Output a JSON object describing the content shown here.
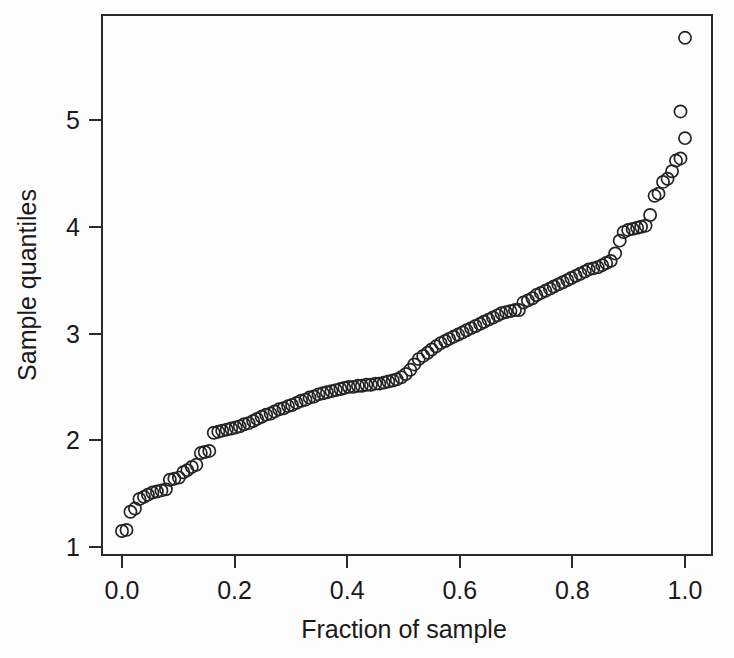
{
  "chart_data": {
    "type": "scatter",
    "title": "",
    "xlabel": "Fraction of sample",
    "ylabel": "Sample quantiles",
    "xlim": [
      -0.022,
      1.045
    ],
    "ylim": [
      1.0,
      5.95
    ],
    "grid": false,
    "legend": null,
    "marker": "open-circle",
    "xticks": [
      0.0,
      0.2,
      0.4,
      0.6,
      0.8,
      1.0
    ],
    "xtick_labels": [
      "0.0",
      "0.2",
      "0.4",
      "0.6",
      "0.8",
      "1.0"
    ],
    "yticks": [
      1,
      2,
      3,
      4,
      5
    ],
    "ytick_labels": [
      "1",
      "2",
      "3",
      "4",
      "5"
    ],
    "n_points": 130,
    "series": [
      {
        "name": "sample quantiles",
        "x": [
          0.0,
          0.008,
          0.015,
          0.023,
          0.031,
          0.039,
          0.046,
          0.054,
          0.062,
          0.07,
          0.078,
          0.085,
          0.093,
          0.101,
          0.109,
          0.116,
          0.124,
          0.132,
          0.14,
          0.147,
          0.155,
          0.163,
          0.171,
          0.178,
          0.186,
          0.194,
          0.202,
          0.209,
          0.217,
          0.225,
          0.233,
          0.24,
          0.248,
          0.256,
          0.264,
          0.271,
          0.279,
          0.287,
          0.295,
          0.302,
          0.31,
          0.318,
          0.326,
          0.333,
          0.341,
          0.349,
          0.357,
          0.364,
          0.372,
          0.38,
          0.388,
          0.395,
          0.403,
          0.411,
          0.419,
          0.426,
          0.434,
          0.442,
          0.45,
          0.457,
          0.465,
          0.473,
          0.481,
          0.488,
          0.496,
          0.504,
          0.512,
          0.519,
          0.527,
          0.535,
          0.543,
          0.55,
          0.558,
          0.566,
          0.574,
          0.581,
          0.589,
          0.597,
          0.605,
          0.612,
          0.62,
          0.628,
          0.636,
          0.643,
          0.651,
          0.659,
          0.667,
          0.674,
          0.682,
          0.69,
          0.698,
          0.705,
          0.713,
          0.721,
          0.729,
          0.736,
          0.744,
          0.752,
          0.76,
          0.767,
          0.775,
          0.783,
          0.791,
          0.798,
          0.806,
          0.814,
          0.822,
          0.829,
          0.837,
          0.845,
          0.853,
          0.86,
          0.868,
          0.876,
          0.884,
          0.891,
          0.899,
          0.907,
          0.915,
          0.922,
          0.93,
          0.938,
          0.946,
          0.953,
          0.961,
          0.969,
          0.977,
          0.984,
          0.992,
          1.0
        ],
        "y": [
          1.15,
          1.16,
          1.33,
          1.36,
          1.45,
          1.47,
          1.49,
          1.51,
          1.52,
          1.53,
          1.54,
          1.63,
          1.64,
          1.65,
          1.7,
          1.72,
          1.75,
          1.77,
          1.88,
          1.89,
          1.9,
          2.07,
          2.08,
          2.09,
          2.1,
          2.11,
          2.12,
          2.13,
          2.15,
          2.16,
          2.18,
          2.2,
          2.22,
          2.24,
          2.25,
          2.27,
          2.29,
          2.3,
          2.32,
          2.33,
          2.35,
          2.37,
          2.38,
          2.4,
          2.41,
          2.43,
          2.44,
          2.45,
          2.46,
          2.47,
          2.48,
          2.49,
          2.5,
          2.5,
          2.51,
          2.51,
          2.52,
          2.52,
          2.53,
          2.53,
          2.54,
          2.55,
          2.56,
          2.57,
          2.59,
          2.62,
          2.66,
          2.71,
          2.76,
          2.79,
          2.82,
          2.85,
          2.88,
          2.91,
          2.93,
          2.95,
          2.97,
          2.99,
          3.01,
          3.03,
          3.05,
          3.07,
          3.09,
          3.11,
          3.13,
          3.15,
          3.17,
          3.19,
          3.2,
          3.21,
          3.22,
          3.22,
          3.29,
          3.31,
          3.33,
          3.36,
          3.38,
          3.4,
          3.42,
          3.44,
          3.46,
          3.48,
          3.5,
          3.52,
          3.54,
          3.56,
          3.58,
          3.6,
          3.61,
          3.62,
          3.64,
          3.66,
          3.68,
          3.75,
          3.87,
          3.95,
          3.97,
          3.98,
          3.99,
          4.0,
          4.01,
          4.11,
          4.29,
          4.31,
          4.42,
          4.45,
          4.52,
          4.62,
          4.64,
          4.83
        ]
      },
      {
        "name": "upper outliers",
        "x": [
          0.992,
          1.0
        ],
        "y": [
          5.08,
          5.77
        ]
      }
    ]
  }
}
